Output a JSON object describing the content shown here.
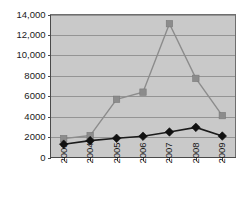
{
  "chart_data": {
    "type": "line",
    "title": "",
    "subtitle": "",
    "xlabel": "",
    "ylabel": "",
    "categories": [
      "2003",
      "2004",
      "2005",
      "2006",
      "2007",
      "2008",
      "2009"
    ],
    "series": [
      {
        "name": "series-square-gray",
        "marker": "square",
        "color": "#8c8c8c",
        "values": [
          1850,
          2150,
          5700,
          6400,
          13100,
          7750,
          4100
        ]
      },
      {
        "name": "series-diamond-black",
        "marker": "diamond",
        "color": "#111111",
        "values": [
          1300,
          1650,
          1880,
          2080,
          2500,
          2950,
          2100
        ]
      }
    ],
    "ylim": [
      0,
      14000
    ],
    "ytick_values": [
      0,
      2000,
      4000,
      6000,
      8000,
      10000,
      12000,
      14000
    ],
    "ytick_labels": [
      "0",
      "2000",
      "4000",
      "6000",
      "8000",
      "10,000",
      "12,000",
      "14,000"
    ],
    "xtick_labels": [
      "2003",
      "2004",
      "2005",
      "2006",
      "2007",
      "2008",
      "2009"
    ],
    "grid": true,
    "grid_axis": "y",
    "legend": "none",
    "plot_background": "#c9c9c9",
    "gridline_color": "#8e8e8e",
    "axis_color": "#4a4a4a",
    "xtick_rotation": -90
  },
  "figure": {
    "background": "#ffffff",
    "width": 241,
    "height": 205
  }
}
